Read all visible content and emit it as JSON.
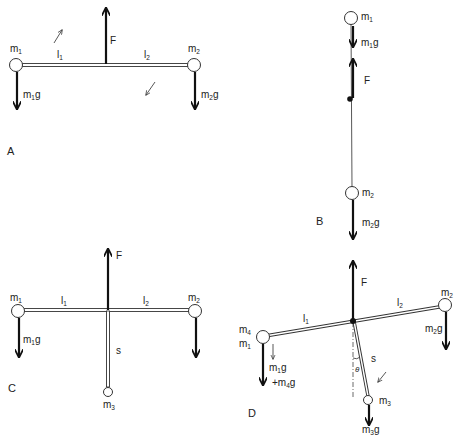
{
  "colors": {
    "ink": "#222222",
    "background": "#ffffff"
  },
  "panels": {
    "A": {
      "label": "A",
      "m1": {
        "base": "m",
        "sub": "1"
      },
      "m2": {
        "base": "m",
        "sub": "2"
      },
      "l1": {
        "base": "l",
        "sub": "1"
      },
      "l2": {
        "base": "l",
        "sub": "2"
      },
      "F": "F",
      "m1g": {
        "base": "m",
        "sub": "1",
        "tail": "g"
      },
      "m2g": {
        "base": "m",
        "sub": "2",
        "tail": "g"
      },
      "rotation_arrows": [
        "arrow-up-right-icon",
        "arrow-down-left-icon"
      ]
    },
    "B": {
      "label": "B",
      "m1": {
        "base": "m",
        "sub": "1"
      },
      "m2": {
        "base": "m",
        "sub": "2"
      },
      "F": "F",
      "m1g": {
        "base": "m",
        "sub": "1",
        "tail": "g"
      },
      "m2g": {
        "base": "m",
        "sub": "2",
        "tail": "g"
      }
    },
    "C": {
      "label": "C",
      "m1": {
        "base": "m",
        "sub": "1"
      },
      "m2": {
        "base": "m",
        "sub": "2"
      },
      "m3": {
        "base": "m",
        "sub": "3"
      },
      "l1": {
        "base": "l",
        "sub": "1"
      },
      "l2": {
        "base": "l",
        "sub": "2"
      },
      "s": "s",
      "F": "F",
      "m1g": {
        "base": "m",
        "sub": "1",
        "tail": "g"
      }
    },
    "D": {
      "label": "D",
      "m1": {
        "base": "m",
        "sub": "1"
      },
      "m2": {
        "base": "m",
        "sub": "2"
      },
      "m3": {
        "base": "m",
        "sub": "3"
      },
      "m4": {
        "base": "m",
        "sub": "4"
      },
      "l1": {
        "base": "l",
        "sub": "1"
      },
      "l2": {
        "base": "l",
        "sub": "2"
      },
      "s": "s",
      "theta": "θ",
      "F": "F",
      "m1g": {
        "base": "m",
        "sub": "1",
        "tail": "g"
      },
      "m2g": {
        "base": "m",
        "sub": "2",
        "tail": "g"
      },
      "m3g": {
        "base": "m",
        "sub": "3",
        "tail": "g"
      },
      "m4g": {
        "prefix": "+",
        "base": "m",
        "sub": "4",
        "tail": "g"
      }
    }
  }
}
